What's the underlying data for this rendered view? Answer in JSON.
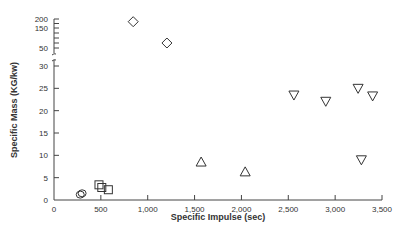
{
  "chart_data": {
    "type": "scatter",
    "title": "",
    "xlabel": "Specific Impulse (sec)",
    "ylabel": "Specific Mass (KG/kw)",
    "xlim": [
      0,
      3500
    ],
    "x_ticks": [
      "0",
      "500",
      "1,000",
      "1,500",
      "2,000",
      "2,500",
      "3,000",
      "3,500"
    ],
    "y_ticks_lower": [
      "0",
      "5",
      "10",
      "15",
      "20",
      "25",
      "30"
    ],
    "y_ticks_upper": [
      "50",
      "150",
      "200"
    ],
    "y_axis_break": "between 30 and 50",
    "grid": false,
    "legend": "none",
    "series": [
      {
        "name": "circle",
        "marker": "circle",
        "points": [
          [
            300,
            1.5
          ],
          [
            280,
            1.2
          ]
        ]
      },
      {
        "name": "square",
        "marker": "square",
        "points": [
          [
            480,
            3.4
          ],
          [
            510,
            2.8
          ],
          [
            580,
            2.3
          ]
        ]
      },
      {
        "name": "diamond",
        "marker": "diamond",
        "points": [
          [
            845,
            185
          ],
          [
            1205,
            75
          ]
        ]
      },
      {
        "name": "triangle-up",
        "marker": "triangle-up",
        "points": [
          [
            1570,
            8.5
          ],
          [
            2040,
            6.3
          ]
        ]
      },
      {
        "name": "triangle-down",
        "marker": "triangle-down",
        "points": [
          [
            2560,
            23.5
          ],
          [
            2900,
            22.1
          ],
          [
            3245,
            25
          ],
          [
            3400,
            23.3
          ],
          [
            3280,
            9
          ]
        ]
      }
    ]
  }
}
